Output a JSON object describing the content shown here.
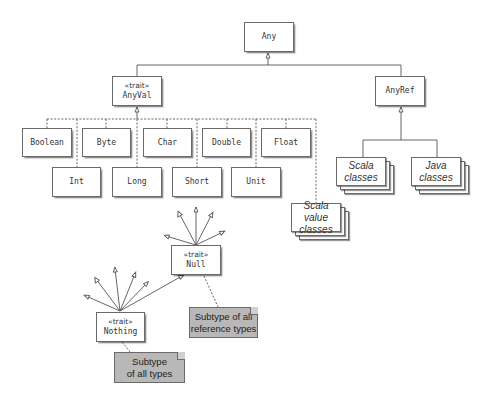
{
  "diagram": {
    "nodes": {
      "any": {
        "label": "Any"
      },
      "anyval": {
        "stereotype": "«trait»",
        "label": "AnyVal"
      },
      "anyref": {
        "label": "AnyRef"
      },
      "boolean": {
        "label": "Boolean"
      },
      "byte": {
        "label": "Byte"
      },
      "char": {
        "label": "Char"
      },
      "double": {
        "label": "Double"
      },
      "float": {
        "label": "Float"
      },
      "int": {
        "label": "Int"
      },
      "long": {
        "label": "Long"
      },
      "short": {
        "label": "Short"
      },
      "unit": {
        "label": "Unit"
      },
      "scala_classes": {
        "line1": "Scala",
        "line2": "classes"
      },
      "java_classes": {
        "line1": "Java",
        "line2": "classes"
      },
      "scala_value_classes": {
        "line1": "Scala value",
        "line2": "classes"
      },
      "null": {
        "stereotype": "«trait»",
        "label": "Null"
      },
      "nothing": {
        "stereotype": "«trait»",
        "label": "Nothing"
      }
    },
    "notes": {
      "null_note": {
        "line1": "Subtype of all",
        "line2": "reference types"
      },
      "nothing_note": {
        "line1": "Subtype",
        "line2": "of all types"
      }
    },
    "edges": [
      {
        "from": "AnyVal",
        "to": "Any",
        "type": "generalization"
      },
      {
        "from": "AnyRef",
        "to": "Any",
        "type": "generalization"
      },
      {
        "from": "Boolean",
        "to": "AnyVal",
        "type": "dashed"
      },
      {
        "from": "Byte",
        "to": "AnyVal",
        "type": "dashed"
      },
      {
        "from": "Char",
        "to": "AnyVal",
        "type": "dashed"
      },
      {
        "from": "Double",
        "to": "AnyVal",
        "type": "dashed"
      },
      {
        "from": "Float",
        "to": "AnyVal",
        "type": "dashed"
      },
      {
        "from": "Int",
        "to": "AnyVal",
        "type": "dashed"
      },
      {
        "from": "Long",
        "to": "AnyVal",
        "type": "dashed"
      },
      {
        "from": "Short",
        "to": "AnyVal",
        "type": "dashed"
      },
      {
        "from": "Unit",
        "to": "AnyVal",
        "type": "dashed"
      },
      {
        "from": "Scala value classes",
        "to": "AnyVal",
        "type": "dashed"
      },
      {
        "from": "Scala classes",
        "to": "AnyRef",
        "type": "generalization"
      },
      {
        "from": "Java classes",
        "to": "AnyRef",
        "type": "generalization"
      },
      {
        "from": "Nothing",
        "to": "Null",
        "type": "generalization"
      }
    ],
    "colors": {
      "line": "#555555",
      "node_fill": "#ffffff",
      "note_fill": "#b8b8b8"
    }
  }
}
